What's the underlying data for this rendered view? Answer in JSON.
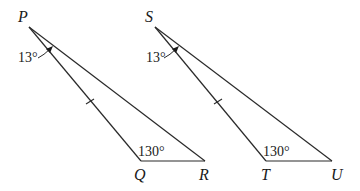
{
  "diagram": {
    "type": "geometry",
    "background": "#ffffff",
    "stroke_color": "#2a2a2a",
    "triangles": [
      {
        "name": "PQR",
        "vertices": {
          "P": {
            "label": "P",
            "x": 29,
            "y": 27
          },
          "Q": {
            "label": "Q",
            "x": 141,
            "y": 161
          },
          "R": {
            "label": "R",
            "x": 205,
            "y": 161
          }
        },
        "angle_at_P": "13°",
        "angle_at_Q": "130°",
        "tick_mark_side": "PQ"
      },
      {
        "name": "STU",
        "vertices": {
          "S": {
            "label": "S",
            "x": 155,
            "y": 27
          },
          "T": {
            "label": "T",
            "x": 266,
            "y": 161
          },
          "U": {
            "label": "U",
            "x": 332,
            "y": 161
          }
        },
        "angle_at_S": "13°",
        "angle_at_T": "130°",
        "tick_mark_side": "ST"
      }
    ]
  }
}
